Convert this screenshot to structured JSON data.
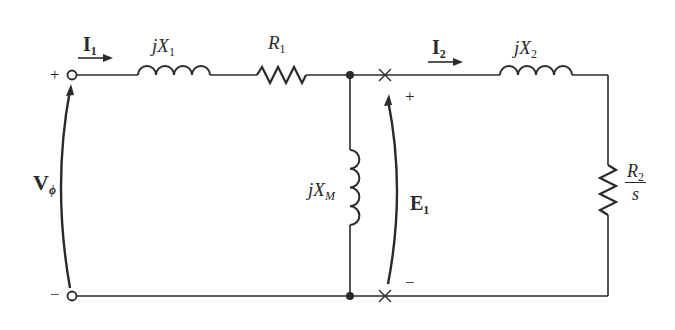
{
  "diagram": {
    "labels": {
      "I1": {
        "main": "I",
        "sub": "1"
      },
      "jX1": {
        "main": "jX",
        "sub": "1"
      },
      "R1": {
        "main": "R",
        "sub": "1"
      },
      "I2": {
        "main": "I",
        "sub": "2"
      },
      "jX2": {
        "main": "jX",
        "sub": "2"
      },
      "R2_over_s": {
        "num_main": "R",
        "num_sub": "2",
        "den": "s"
      },
      "jXM": {
        "main": "jX",
        "sub": "M"
      },
      "E1": {
        "main": "E",
        "sub": "1"
      },
      "Vphi": {
        "main": "V",
        "sub": "ϕ"
      },
      "plus_input": "+",
      "minus_input": "−",
      "plus_E1": "+",
      "minus_E1": "−"
    },
    "components": [
      {
        "id": "jX1",
        "type": "inductor",
        "orientation": "horizontal"
      },
      {
        "id": "R1",
        "type": "resistor",
        "orientation": "horizontal"
      },
      {
        "id": "jXM",
        "type": "inductor",
        "orientation": "vertical"
      },
      {
        "id": "jX2",
        "type": "inductor",
        "orientation": "horizontal"
      },
      {
        "id": "R2_over_s",
        "type": "resistor",
        "orientation": "vertical"
      }
    ],
    "stroke_color": "#2a2a2a"
  }
}
